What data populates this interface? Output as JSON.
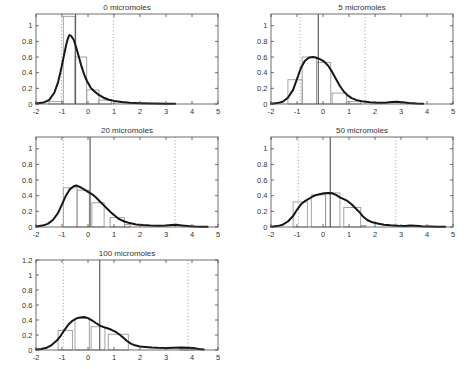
{
  "figure": {
    "background": "#ffffff",
    "colors": {
      "axis": "#4a4a4a",
      "tick_label": "#333333",
      "title": "#333333",
      "bar_outline": "#999999",
      "density_curve": "#161616",
      "center_line": "#606060",
      "quantile_line": "#8e8e8e"
    }
  },
  "chart_data": [
    {
      "type": "histogram",
      "title": "0 micromoles",
      "xlabel": "",
      "ylabel": "",
      "xlim": [
        -2,
        5
      ],
      "ylim": [
        0,
        1.15
      ],
      "xticks": [
        -2,
        -1,
        0,
        1,
        2,
        3,
        4,
        5
      ],
      "xtick_labels": [
        "-2",
        "-1",
        "0",
        "1",
        "2",
        "3",
        "4",
        "5"
      ],
      "yticks": [
        0,
        0.2,
        0.4,
        0.6,
        0.8,
        1
      ],
      "ytick_labels": [
        "0",
        "0.2",
        "0.4",
        "0.6",
        "0.8",
        "1"
      ],
      "bars": [
        {
          "x0": -1.5,
          "x1": -0.95,
          "h": 0.03
        },
        {
          "x0": -0.95,
          "x1": -0.5,
          "h": 1.12
        },
        {
          "x0": -0.5,
          "x1": -0.05,
          "h": 0.6
        },
        {
          "x0": -0.05,
          "x1": 0.42,
          "h": 0.18
        },
        {
          "x0": 0.42,
          "x1": 0.9,
          "h": 0.05
        }
      ],
      "center_line_x": -0.48,
      "quantile_lines_x": [
        -1.02,
        0.97
      ],
      "density_curve": [
        [
          -2,
          0.005
        ],
        [
          -1.7,
          0.02
        ],
        [
          -1.5,
          0.05
        ],
        [
          -1.3,
          0.14
        ],
        [
          -1.15,
          0.28
        ],
        [
          -1.05,
          0.42
        ],
        [
          -0.95,
          0.58
        ],
        [
          -0.85,
          0.74
        ],
        [
          -0.78,
          0.83
        ],
        [
          -0.72,
          0.88
        ],
        [
          -0.65,
          0.87
        ],
        [
          -0.55,
          0.82
        ],
        [
          -0.45,
          0.72
        ],
        [
          -0.35,
          0.6
        ],
        [
          -0.25,
          0.48
        ],
        [
          -0.15,
          0.38
        ],
        [
          -0.05,
          0.3
        ],
        [
          0.1,
          0.21
        ],
        [
          0.25,
          0.16
        ],
        [
          0.4,
          0.12
        ],
        [
          0.6,
          0.08
        ],
        [
          0.8,
          0.055
        ],
        [
          1.0,
          0.04
        ],
        [
          1.3,
          0.025
        ],
        [
          1.6,
          0.015
        ],
        [
          2.0,
          0.01
        ],
        [
          2.5,
          0.006
        ],
        [
          3.0,
          0.003
        ],
        [
          3.35,
          0.002
        ]
      ]
    },
    {
      "type": "histogram",
      "title": "5 micromoles",
      "xlabel": "",
      "ylabel": "",
      "xlim": [
        -2,
        5
      ],
      "ylim": [
        0,
        1.15
      ],
      "xticks": [
        -2,
        -1,
        0,
        1,
        2,
        3,
        4,
        5
      ],
      "xtick_labels": [
        "-2",
        "-1",
        "0",
        "1",
        "2",
        "3",
        "4",
        "5"
      ],
      "yticks": [
        0,
        0.2,
        0.4,
        0.6,
        0.8,
        1
      ],
      "ytick_labels": [
        "0",
        "0.2",
        "0.4",
        "0.6",
        "0.8",
        "1"
      ],
      "bars": [
        {
          "x0": -1.35,
          "x1": -0.8,
          "h": 0.31
        },
        {
          "x0": -0.8,
          "x1": -0.25,
          "h": 0.6
        },
        {
          "x0": -0.25,
          "x1": 0.3,
          "h": 0.53
        },
        {
          "x0": 0.35,
          "x1": 0.9,
          "h": 0.14
        },
        {
          "x0": 0.9,
          "x1": 1.45,
          "h": 0.03
        }
      ],
      "center_line_x": -0.18,
      "quantile_lines_x": [
        -0.88,
        1.62
      ],
      "density_curve": [
        [
          -2,
          0.003
        ],
        [
          -1.75,
          0.012
        ],
        [
          -1.55,
          0.03
        ],
        [
          -1.35,
          0.08
        ],
        [
          -1.15,
          0.18
        ],
        [
          -1.0,
          0.32
        ],
        [
          -0.85,
          0.46
        ],
        [
          -0.7,
          0.55
        ],
        [
          -0.55,
          0.59
        ],
        [
          -0.4,
          0.6
        ],
        [
          -0.25,
          0.59
        ],
        [
          -0.1,
          0.57
        ],
        [
          0.05,
          0.54
        ],
        [
          0.2,
          0.49
        ],
        [
          0.35,
          0.41
        ],
        [
          0.5,
          0.32
        ],
        [
          0.65,
          0.23
        ],
        [
          0.8,
          0.16
        ],
        [
          0.95,
          0.11
        ],
        [
          1.1,
          0.075
        ],
        [
          1.3,
          0.05
        ],
        [
          1.5,
          0.035
        ],
        [
          1.8,
          0.022
        ],
        [
          2.1,
          0.016
        ],
        [
          2.4,
          0.016
        ],
        [
          2.65,
          0.025
        ],
        [
          2.85,
          0.03
        ],
        [
          3.05,
          0.022
        ],
        [
          3.3,
          0.012
        ],
        [
          3.6,
          0.005
        ],
        [
          3.85,
          0.002
        ]
      ]
    },
    {
      "type": "histogram",
      "title": "20 micromoles",
      "xlabel": "",
      "ylabel": "",
      "xlim": [
        -2,
        5
      ],
      "ylim": [
        0,
        1.15
      ],
      "xticks": [
        -2,
        -1,
        0,
        1,
        2,
        3,
        4,
        5
      ],
      "xtick_labels": [
        "-2",
        "-1",
        "0",
        "1",
        "2",
        "3",
        "4",
        "5"
      ],
      "yticks": [
        0,
        0.2,
        0.4,
        0.6,
        0.8,
        1
      ],
      "ytick_labels": [
        "0",
        "0.2",
        "0.4",
        "0.6",
        "0.8",
        "1"
      ],
      "bars": [
        {
          "x0": -0.95,
          "x1": -0.42,
          "h": 0.5
        },
        {
          "x0": -0.42,
          "x1": 0.05,
          "h": 0.47
        },
        {
          "x0": 0.15,
          "x1": 0.62,
          "h": 0.31
        },
        {
          "x0": 0.85,
          "x1": 1.4,
          "h": 0.12
        },
        {
          "x0": 1.4,
          "x1": 1.62,
          "h": 0.03
        }
      ],
      "center_line_x": 0.08,
      "quantile_lines_x": [
        -0.95,
        3.35
      ],
      "density_curve": [
        [
          -2,
          0.008
        ],
        [
          -1.75,
          0.018
        ],
        [
          -1.55,
          0.04
        ],
        [
          -1.35,
          0.09
        ],
        [
          -1.15,
          0.18
        ],
        [
          -1.0,
          0.29
        ],
        [
          -0.85,
          0.4
        ],
        [
          -0.7,
          0.48
        ],
        [
          -0.55,
          0.52
        ],
        [
          -0.45,
          0.53
        ],
        [
          -0.3,
          0.51
        ],
        [
          -0.15,
          0.48
        ],
        [
          0,
          0.45
        ],
        [
          0.15,
          0.42
        ],
        [
          0.3,
          0.38
        ],
        [
          0.45,
          0.33
        ],
        [
          0.6,
          0.28
        ],
        [
          0.75,
          0.23
        ],
        [
          0.9,
          0.18
        ],
        [
          1.05,
          0.14
        ],
        [
          1.2,
          0.1
        ],
        [
          1.4,
          0.07
        ],
        [
          1.6,
          0.05
        ],
        [
          1.85,
          0.033
        ],
        [
          2.1,
          0.024
        ],
        [
          2.4,
          0.018
        ],
        [
          2.7,
          0.016
        ],
        [
          3.0,
          0.02
        ],
        [
          3.2,
          0.026
        ],
        [
          3.4,
          0.028
        ],
        [
          3.6,
          0.02
        ],
        [
          3.85,
          0.012
        ],
        [
          4.1,
          0.007
        ],
        [
          4.35,
          0.004
        ],
        [
          4.6,
          0.002
        ]
      ]
    },
    {
      "type": "histogram",
      "title": "50 micromoles",
      "xlabel": "",
      "ylabel": "",
      "xlim": [
        -2,
        5
      ],
      "ylim": [
        0,
        1.15
      ],
      "xticks": [
        -2,
        -1,
        0,
        1,
        2,
        3,
        4,
        5
      ],
      "xtick_labels": [
        "-2",
        "-1",
        "0",
        "1",
        "2",
        "3",
        "4",
        "5"
      ],
      "yticks": [
        0,
        0.2,
        0.4,
        0.6,
        0.8,
        1
      ],
      "ytick_labels": [
        "0",
        "0.2",
        "0.4",
        "0.6",
        "0.8",
        "1"
      ],
      "bars": [
        {
          "x0": -1.15,
          "x1": -0.6,
          "h": 0.32
        },
        {
          "x0": -0.45,
          "x1": 0.1,
          "h": 0.41
        },
        {
          "x0": 0.1,
          "x1": 0.65,
          "h": 0.435
        },
        {
          "x0": 0.8,
          "x1": 1.45,
          "h": 0.25
        },
        {
          "x0": 1.45,
          "x1": 1.65,
          "h": 0.02
        }
      ],
      "center_line_x": 0.28,
      "quantile_lines_x": [
        -0.95,
        2.8
      ],
      "density_curve": [
        [
          -2,
          0.004
        ],
        [
          -1.75,
          0.012
        ],
        [
          -1.55,
          0.03
        ],
        [
          -1.35,
          0.07
        ],
        [
          -1.15,
          0.14
        ],
        [
          -1.0,
          0.22
        ],
        [
          -0.85,
          0.29
        ],
        [
          -0.7,
          0.33
        ],
        [
          -0.55,
          0.36
        ],
        [
          -0.4,
          0.39
        ],
        [
          -0.25,
          0.41
        ],
        [
          -0.1,
          0.42
        ],
        [
          0.05,
          0.43
        ],
        [
          0.2,
          0.435
        ],
        [
          0.35,
          0.43
        ],
        [
          0.5,
          0.41
        ],
        [
          0.65,
          0.38
        ],
        [
          0.8,
          0.355
        ],
        [
          0.95,
          0.33
        ],
        [
          1.1,
          0.29
        ],
        [
          1.25,
          0.24
        ],
        [
          1.4,
          0.19
        ],
        [
          1.55,
          0.13
        ],
        [
          1.7,
          0.09
        ],
        [
          1.9,
          0.06
        ],
        [
          2.1,
          0.045
        ],
        [
          2.35,
          0.03
        ],
        [
          2.6,
          0.022
        ],
        [
          2.9,
          0.015
        ],
        [
          3.15,
          0.014
        ],
        [
          3.35,
          0.018
        ],
        [
          3.55,
          0.016
        ],
        [
          3.8,
          0.01
        ],
        [
          4.1,
          0.006
        ],
        [
          4.4,
          0.004
        ],
        [
          4.7,
          0.002
        ]
      ]
    },
    {
      "type": "histogram",
      "title": "100 micromoles",
      "xlabel": "",
      "ylabel": "",
      "xlim": [
        -2,
        5
      ],
      "ylim": [
        0,
        1.2
      ],
      "xticks": [
        -2,
        -1,
        0,
        1,
        2,
        3,
        4,
        5
      ],
      "xtick_labels": [
        "-2",
        "-1",
        "0",
        "1",
        "2",
        "3",
        "4",
        "5"
      ],
      "yticks": [
        0,
        0.2,
        0.4,
        0.6,
        0.8,
        1,
        1.2
      ],
      "ytick_labels": [
        "0",
        "0.2",
        "0.4",
        "0.6",
        "0.8",
        "1",
        "1.2"
      ],
      "bars": [
        {
          "x0": -1.15,
          "x1": -0.6,
          "h": 0.26
        },
        {
          "x0": -0.5,
          "x1": 0.05,
          "h": 0.42
        },
        {
          "x0": 0.12,
          "x1": 0.65,
          "h": 0.31
        },
        {
          "x0": 0.78,
          "x1": 1.55,
          "h": 0.21
        },
        {
          "x0": 3.55,
          "x1": 4.1,
          "h": 0.02
        }
      ],
      "center_line_x": 0.45,
      "quantile_lines_x": [
        -0.95,
        3.85
      ],
      "density_curve": [
        [
          -2,
          0.008
        ],
        [
          -1.8,
          0.015
        ],
        [
          -1.6,
          0.03
        ],
        [
          -1.4,
          0.065
        ],
        [
          -1.2,
          0.125
        ],
        [
          -1.05,
          0.19
        ],
        [
          -0.9,
          0.27
        ],
        [
          -0.75,
          0.34
        ],
        [
          -0.6,
          0.39
        ],
        [
          -0.45,
          0.42
        ],
        [
          -0.3,
          0.435
        ],
        [
          -0.15,
          0.44
        ],
        [
          0,
          0.425
        ],
        [
          0.15,
          0.395
        ],
        [
          0.3,
          0.36
        ],
        [
          0.45,
          0.33
        ],
        [
          0.6,
          0.305
        ],
        [
          0.75,
          0.29
        ],
        [
          0.9,
          0.27
        ],
        [
          1.05,
          0.245
        ],
        [
          1.2,
          0.21
        ],
        [
          1.35,
          0.165
        ],
        [
          1.5,
          0.12
        ],
        [
          1.65,
          0.085
        ],
        [
          1.8,
          0.062
        ],
        [
          2.0,
          0.047
        ],
        [
          2.2,
          0.04
        ],
        [
          2.45,
          0.034
        ],
        [
          2.7,
          0.03
        ],
        [
          3.0,
          0.028
        ],
        [
          3.3,
          0.03
        ],
        [
          3.6,
          0.032
        ],
        [
          3.85,
          0.031
        ],
        [
          4.05,
          0.025
        ],
        [
          4.25,
          0.015
        ],
        [
          4.45,
          0.006
        ]
      ]
    }
  ]
}
